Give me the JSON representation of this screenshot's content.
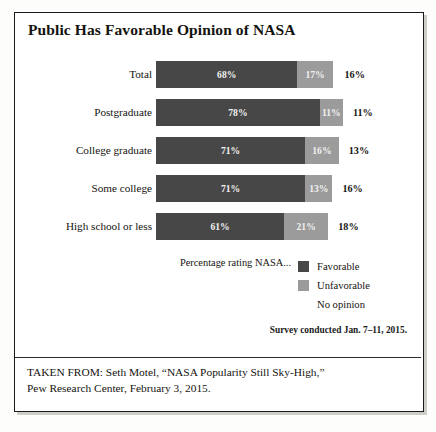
{
  "figure": {
    "title": "Public Has Favorable Opinion of NASA",
    "survey_note": "Survey conducted Jan. 7–11, 2015.",
    "citation_line1": "TAKEN FROM: Seth Motel, “NASA Popularity Still Sky-High,”",
    "citation_line2": "Pew Research Center, February 3, 2015."
  },
  "legend": {
    "caption": "Percentage rating NASA...",
    "items": [
      {
        "label": "Favorable",
        "color": "#474747",
        "swatch": "favorable-swatch"
      },
      {
        "label": "Unfavorable",
        "color": "#9b9b9b",
        "swatch": "unfavorable-swatch"
      },
      {
        "label": "No opinion",
        "color": "#ffffff",
        "swatch": "no-opinion-swatch"
      }
    ]
  },
  "chart_data": {
    "type": "bar",
    "orientation": "horizontal",
    "stacked": true,
    "stacked_total": 100,
    "title": "Public Has Favorable Opinion of NASA",
    "subtitle": "Percentage rating NASA...",
    "xlabel": "",
    "ylabel": "",
    "xlim": [
      0,
      100
    ],
    "grid": false,
    "legend_position": "bottom-right",
    "categories": [
      "Total",
      "Postgraduate",
      "College graduate",
      "Some college",
      "High school or less"
    ],
    "series": [
      {
        "name": "Favorable",
        "color": "#474747",
        "values": [
          68,
          78,
          71,
          71,
          61
        ]
      },
      {
        "name": "Unfavorable",
        "color": "#9b9b9b",
        "values": [
          17,
          11,
          16,
          13,
          21
        ]
      },
      {
        "name": "No opinion",
        "color": "#ffffff",
        "values": [
          16,
          11,
          13,
          16,
          18
        ]
      }
    ],
    "annotation": "Survey conducted Jan. 7–11, 2015.",
    "source": "Seth Motel, “NASA Popularity Still Sky-High,” Pew Research Center, February 3, 2015."
  },
  "rows": [
    {
      "label": "Total",
      "favorable": "68%",
      "favorable_value": 68,
      "unfavorable": "17%",
      "unfavorable_value": 17,
      "no_opinion": "16%",
      "no_opinion_value": 16
    },
    {
      "label": "Postgraduate",
      "favorable": "78%",
      "favorable_value": 78,
      "unfavorable": "11%",
      "unfavorable_value": 11,
      "no_opinion": "11%",
      "no_opinion_value": 11
    },
    {
      "label": "College graduate",
      "favorable": "71%",
      "favorable_value": 71,
      "unfavorable": "16%",
      "unfavorable_value": 16,
      "no_opinion": "13%",
      "no_opinion_value": 13
    },
    {
      "label": "Some college",
      "favorable": "71%",
      "favorable_value": 71,
      "unfavorable": "13%",
      "unfavorable_value": 13,
      "no_opinion": "16%",
      "no_opinion_value": 16
    },
    {
      "label": "High school or less",
      "favorable": "61%",
      "favorable_value": 61,
      "unfavorable": "21%",
      "unfavorable_value": 21,
      "no_opinion": "18%",
      "no_opinion_value": 18
    }
  ]
}
